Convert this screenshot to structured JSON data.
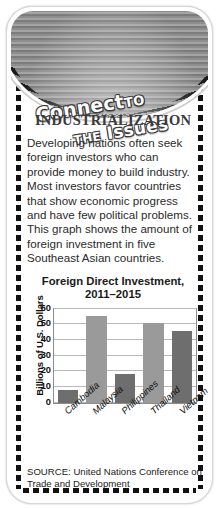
{
  "banner": {
    "line1_main": "Connect",
    "line1_small": "TO",
    "line2_small": "THE",
    "line2_main": "Issues"
  },
  "heading": "INDUSTRIALIZATION",
  "body_text": "Developing nations often seek foreign investors who can provide money to build industry. Most investors favor countries that show economic progress and have few political problems. This graph shows the amount of foreign investment in five Southeast Asian countries.",
  "source": "SOURCE: United Nations Conference on Trade and Development",
  "colors": {
    "bar_dark": "#6e6e6e",
    "bar_light": "#9a9a9a",
    "banner_gray": "#8e8e8e",
    "heading_gray": "#3a3a3a"
  },
  "chart_data": {
    "type": "bar",
    "title": "Foreign Direct Investment, 2011–2015",
    "title_line1": "Foreign Direct Investment,",
    "title_line2": "2011–2015",
    "xlabel": "",
    "ylabel": "Billions of U.S. Dollars",
    "categories": [
      "Cambodia",
      "Malaysia",
      "Philippines",
      "Thailand",
      "Vietnam"
    ],
    "values": [
      8,
      55.5,
      18.5,
      51,
      45.5
    ],
    "bar_colors": [
      "#6e6e6e",
      "#9a9a9a",
      "#6e6e6e",
      "#9a9a9a",
      "#6e6e6e"
    ],
    "ylim": [
      0,
      60
    ],
    "yticks": [
      0,
      10,
      20,
      30,
      40,
      50,
      60
    ],
    "grid": true,
    "legend": "none"
  }
}
